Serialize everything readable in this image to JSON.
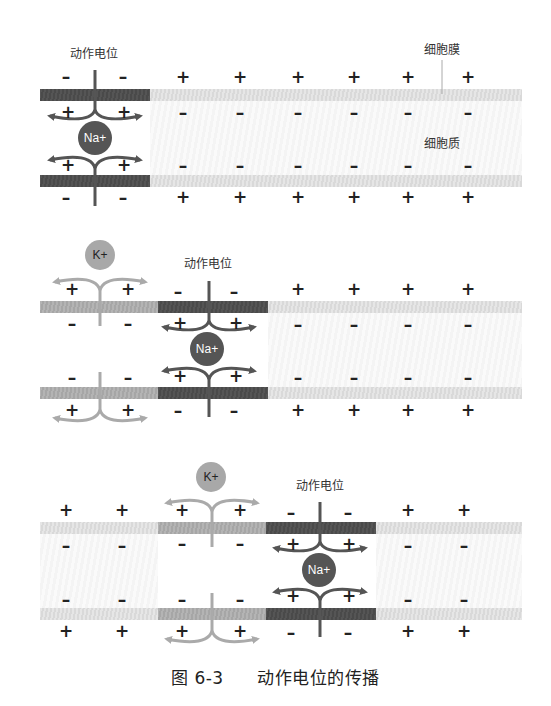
{
  "labels": {
    "action_potential": "动作电位",
    "membrane": "细胞膜",
    "cytoplasm": "细胞质",
    "sodium_ion": "Na+",
    "potassium_ion": "K+"
  },
  "symbols": {
    "plus": "+",
    "minus": "–"
  },
  "caption": {
    "figure_number": "图 6-3",
    "title": "动作电位的传播"
  },
  "colors": {
    "depolarized_membrane": "#4f4f4f",
    "repolarizing_membrane": "#aaaaaa",
    "resting_membrane": "#dedede",
    "na_ion": "#555555",
    "k_ion": "#a8a8a8"
  },
  "panels": [
    {
      "id": "panel-1",
      "description": "Action potential at left; Na+ influx",
      "segments": [
        "depolarized",
        "resting"
      ],
      "outside_top": [
        "-",
        "-",
        "+",
        "+",
        "+",
        "+",
        "+",
        "+"
      ],
      "inside_top": [
        "+",
        "+",
        "-",
        "-",
        "-",
        "-",
        "-",
        "-"
      ],
      "inside_bottom": [
        "+",
        "+",
        "-",
        "-",
        "-",
        "-",
        "-",
        "-"
      ],
      "outside_bottom": [
        "-",
        "-",
        "+",
        "+",
        "+",
        "+",
        "+",
        "+"
      ]
    },
    {
      "id": "panel-2",
      "description": "Action potential moved right; K+ efflux behind it",
      "segments": [
        "repolarizing",
        "depolarized",
        "resting"
      ],
      "outside_top": [
        "+",
        "+",
        "-",
        "-",
        "+",
        "+",
        "+",
        "+"
      ],
      "inside_top": [
        "-",
        "-",
        "+",
        "+",
        "-",
        "-",
        "-",
        "-"
      ],
      "inside_bottom": [
        "-",
        "-",
        "+",
        "+",
        "-",
        "-",
        "-",
        "-"
      ],
      "outside_bottom": [
        "+",
        "+",
        "-",
        "-",
        "+",
        "+",
        "+",
        "+"
      ]
    },
    {
      "id": "panel-3",
      "description": "Action potential moved further right",
      "segments": [
        "resting",
        "repolarizing",
        "depolarized",
        "resting"
      ],
      "outside_top": [
        "+",
        "+",
        "+",
        "+",
        "-",
        "-",
        "+",
        "+"
      ],
      "inside_top": [
        "-",
        "-",
        "-",
        "-",
        "+",
        "+",
        "-",
        "-"
      ],
      "inside_bottom": [
        "-",
        "-",
        "-",
        "-",
        "+",
        "+",
        "-",
        "-"
      ],
      "outside_bottom": [
        "+",
        "+",
        "+",
        "+",
        "-",
        "-",
        "+",
        "+"
      ]
    }
  ]
}
